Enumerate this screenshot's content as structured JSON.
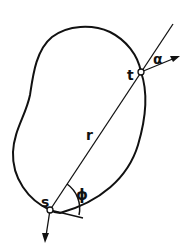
{
  "diagram": {
    "labels": {
      "t": "t",
      "s": "s",
      "r": "r",
      "alpha": "α",
      "phi": "ϕ"
    },
    "colors": {
      "stroke": "#111111",
      "background": "#ffffff"
    }
  }
}
